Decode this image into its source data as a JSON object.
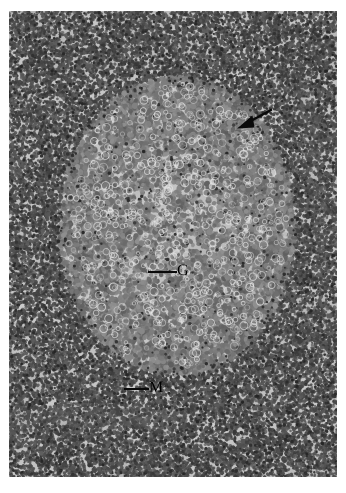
{
  "figure": {
    "kind": "histology-micrograph",
    "stain": "grayscale",
    "background_color": "#ffffff",
    "frame": {
      "left": 9,
      "top": 11,
      "width": 328,
      "height": 466
    },
    "tissue": {
      "base_color": "#b4b4b4",
      "nucleus_dark_color": "#3c3c3c",
      "nucleus_mid_color": "#5a5a5a",
      "pale_zone_color": "#c6c6c6",
      "highlight_color": "#e8e8e8"
    }
  },
  "annotations": {
    "ink_color": "#0a0a0a",
    "labels": [
      {
        "id": "germinal-center",
        "text": "G",
        "x": 168,
        "y": 252
      },
      {
        "id": "mantle-zone",
        "text": "M",
        "x": 140,
        "y": 369
      }
    ],
    "leaders": [
      {
        "id": "leader-germinal-center",
        "x": 139,
        "y": 260,
        "length": 29
      },
      {
        "id": "leader-mantle-zone",
        "x": 115,
        "y": 377,
        "length": 25
      }
    ],
    "arrow": {
      "id": "region-arrow",
      "tail_x": 262,
      "tail_y": 99,
      "tip_x": 228,
      "tip_y": 117
    }
  },
  "chart_data": {
    "type": "heatmap",
    "title": "",
    "xlabel": "",
    "ylabel": "",
    "zones": [
      {
        "name": "germinal-center",
        "marker": "G",
        "center_x": 172,
        "center_y": 250,
        "radius_x": 120,
        "radius_y": 150,
        "tone": 198,
        "density": 0.32,
        "nucleus_size": 2.6
      },
      {
        "name": "mantle-zone",
        "marker": "M",
        "center_x": 164,
        "center_y": 250,
        "radius_x": 165,
        "radius_y": 215,
        "tone": 168,
        "density": 0.95,
        "nucleus_size": 1.9
      },
      {
        "name": "paracortex",
        "marker": "",
        "center_x": 164,
        "center_y": 233,
        "radius_x": 330,
        "radius_y": 470,
        "tone": 176,
        "density": 0.78,
        "nucleus_size": 2.0
      }
    ],
    "arrow_target": {
      "name": "follicle-mantle-interface",
      "x": 228,
      "y": 117
    }
  }
}
